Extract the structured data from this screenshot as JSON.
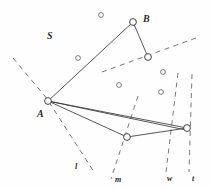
{
  "figure": {
    "type": "geometry-diagram",
    "width": 211,
    "height": 188,
    "background_color": "#fefefe",
    "stroke_color": "#3a3a3a",
    "dash_color": "#6b6b6b",
    "label_color": "#2b2b2b"
  },
  "labels": {
    "set_label": "S",
    "point_a": "A",
    "point_b": "B",
    "line_l": "l",
    "line_m": "m",
    "line_w": "w",
    "line_t": "t"
  },
  "label_positions": {
    "set_label": {
      "x": 47,
      "y": 31
    },
    "point_a": {
      "x": 37,
      "y": 109
    },
    "point_b": {
      "x": 143,
      "y": 14
    },
    "line_l": {
      "x": 75,
      "y": 163
    },
    "line_m": {
      "x": 115,
      "y": 176
    },
    "line_w": {
      "x": 167,
      "y": 175
    },
    "line_t": {
      "x": 192,
      "y": 175
    }
  },
  "vertices": [
    {
      "id": "A",
      "x": 48,
      "y": 101,
      "r": 3.4,
      "labeled": true
    },
    {
      "id": "B",
      "x": 133,
      "y": 22,
      "r": 3.4,
      "labeled": true
    },
    {
      "id": "v1",
      "x": 148,
      "y": 57,
      "r": 3.4,
      "labeled": false
    },
    {
      "id": "v2",
      "x": 127,
      "y": 137,
      "r": 3.4,
      "labeled": false
    },
    {
      "id": "v3",
      "x": 187,
      "y": 128,
      "r": 3.4,
      "labeled": false
    }
  ],
  "scatter_points": [
    {
      "x": 101,
      "y": 15,
      "r": 2.4
    },
    {
      "x": 78,
      "y": 58,
      "r": 2.4
    },
    {
      "x": 119,
      "y": 85,
      "r": 2.4
    },
    {
      "x": 163,
      "y": 72,
      "r": 2.4
    },
    {
      "x": 161,
      "y": 92,
      "r": 2.4
    }
  ],
  "solid_edges": [
    {
      "name": "edge-a-b",
      "x1": 48,
      "y1": 101,
      "x2": 133,
      "y2": 22
    },
    {
      "name": "edge-b-v1",
      "x1": 133,
      "y1": 22,
      "x2": 148,
      "y2": 57
    },
    {
      "name": "edge-a-v2",
      "x1": 48,
      "y1": 101,
      "x2": 127,
      "y2": 137
    },
    {
      "name": "edge-a-v3",
      "x1": 48,
      "y1": 101,
      "x2": 187,
      "y2": 128
    },
    {
      "name": "edge-v2-v3",
      "x1": 127,
      "y1": 137,
      "x2": 187,
      "y2": 128
    },
    {
      "name": "edge-a-lower",
      "x1": 48,
      "y1": 101,
      "x2": 186,
      "y2": 130
    }
  ],
  "dashed_lines": [
    {
      "name": "dashed-upper-left",
      "x1": 13,
      "y1": 58,
      "x2": 49,
      "y2": 101
    },
    {
      "name": "dashed-line-l",
      "x1": 49,
      "y1": 102,
      "x2": 94,
      "y2": 172
    },
    {
      "name": "dashed-line-m",
      "x1": 138,
      "y1": 96,
      "x2": 111,
      "y2": 179
    },
    {
      "name": "dashed-upper-right",
      "x1": 102,
      "y1": 72,
      "x2": 196,
      "y2": 38
    },
    {
      "name": "dashed-line-w",
      "x1": 178,
      "y1": 73,
      "x2": 166,
      "y2": 172
    },
    {
      "name": "dashed-line-t",
      "x1": 192,
      "y1": 74,
      "x2": 189,
      "y2": 172
    }
  ]
}
